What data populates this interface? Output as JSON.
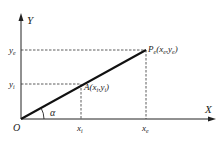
{
  "diagram": {
    "axes": {
      "x_label": "X",
      "y_label": "Y",
      "origin_label": "O"
    },
    "angle_label": "α",
    "point_a": {
      "name": "A",
      "coords": "(x",
      "sub_x": "i",
      "mid": ",y",
      "sub_y": "i",
      "close": ")"
    },
    "point_e": {
      "name": "P",
      "name_sub": "e",
      "coords": "(x",
      "sub_x": "e",
      "mid": ",y",
      "sub_y": "e",
      "close": ")"
    },
    "ticks": {
      "x_i": {
        "base": "x",
        "sub": "i"
      },
      "x_e": {
        "base": "x",
        "sub": "e"
      },
      "y_i": {
        "base": "y",
        "sub": "i"
      },
      "y_e": {
        "base": "y",
        "sub": "e"
      }
    }
  }
}
